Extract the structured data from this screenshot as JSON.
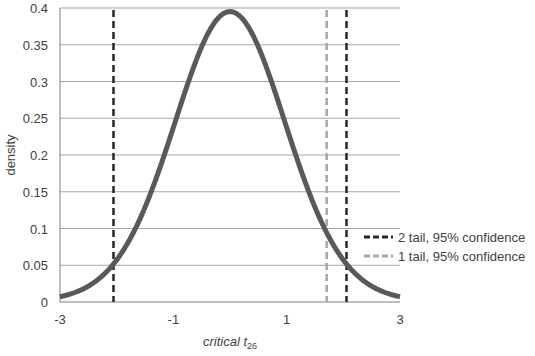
{
  "chart_data": {
    "type": "line",
    "title": "",
    "xlabel": "critical t",
    "xlabel_subscript": "26",
    "ylabel": "density",
    "xlim": [
      -3,
      3
    ],
    "ylim": [
      0,
      0.4
    ],
    "x_ticks": [
      "-3",
      "-1",
      "1",
      "3"
    ],
    "y_ticks": [
      "0",
      "0.05",
      "0.1",
      "0.15",
      "0.2",
      "0.25",
      "0.3",
      "0.35",
      "0.4"
    ],
    "grid": "horizontal",
    "degrees_of_freedom": 26,
    "series": [
      {
        "name": "t density (df=26)",
        "color": "#595959",
        "x": [
          -3,
          -2.5,
          -2,
          -1.5,
          -1,
          -0.5,
          0,
          0.5,
          1,
          1.5,
          2,
          2.5,
          3
        ],
        "values": [
          0.007,
          0.021,
          0.056,
          0.127,
          0.237,
          0.345,
          0.394,
          0.345,
          0.237,
          0.127,
          0.056,
          0.021,
          0.007
        ]
      }
    ],
    "vlines": [
      {
        "name": "2 tail, 95% confidence",
        "x": [
          -2.056,
          2.056
        ],
        "color": "#262626",
        "style": "dashed"
      },
      {
        "name": "1 tail, 95% confidence",
        "x": [
          1.706
        ],
        "color": "#a6a6a6",
        "style": "dashed"
      }
    ],
    "legend": {
      "position": "right",
      "entries": [
        "2 tail, 95% confidence",
        "1 tail, 95% confidence"
      ]
    }
  }
}
